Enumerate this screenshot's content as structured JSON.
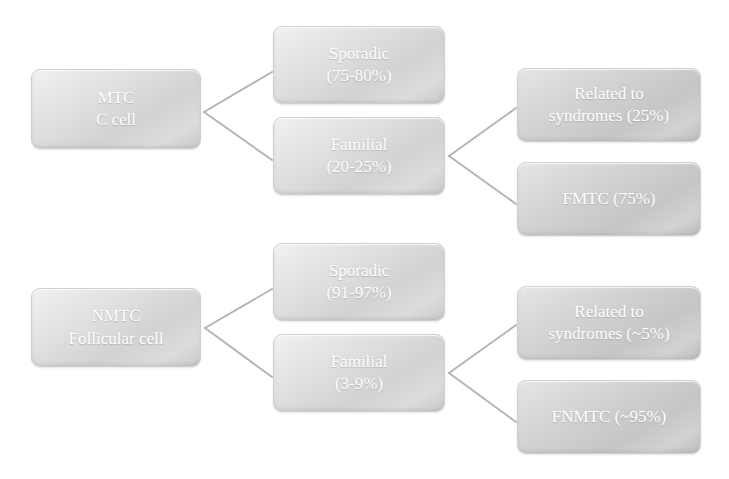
{
  "diagram": {
    "type": "hierarchy-tree",
    "orientation": "left-to-right",
    "colors": {
      "node_fill_light": "#dddddd",
      "node_fill_dark": "#cfcfcf",
      "node_text": "#ffffff",
      "connector": "#b3b3b3",
      "background": "#ffffff"
    },
    "branches": [
      {
        "id": "mtc",
        "root": {
          "id": "node-mtc",
          "line1": "MTC",
          "line2": "C cell"
        },
        "children": [
          {
            "id": "node-mtc-sporadic",
            "line1": "Sporadic",
            "line2": "(75-80%)",
            "children": []
          },
          {
            "id": "node-mtc-familial",
            "line1": "Familial",
            "line2": "(20-25%)",
            "children": [
              {
                "id": "node-mtc-syndromes",
                "line1": "Related to",
                "line2": "syndromes (25%)"
              },
              {
                "id": "node-fmtc",
                "line1": "FMTC (75%)",
                "line2": ""
              }
            ]
          }
        ]
      },
      {
        "id": "nmtc",
        "root": {
          "id": "node-nmtc",
          "line1": "NMTC",
          "line2": "Follicular cell"
        },
        "children": [
          {
            "id": "node-nmtc-sporadic",
            "line1": "Sporadic",
            "line2": "(91-97%)",
            "children": []
          },
          {
            "id": "node-nmtc-familial",
            "line1": "Familial",
            "line2": "(3-9%)",
            "children": [
              {
                "id": "node-nmtc-syndromes",
                "line1": "Related to",
                "line2": "syndromes (~5%)"
              },
              {
                "id": "node-fnmtc",
                "line1": "FNMTC (~95%)",
                "line2": ""
              }
            ]
          }
        ]
      }
    ]
  },
  "nodes": {
    "mtc": {
      "line1": "MTC",
      "line2": "C cell"
    },
    "mtc_sporadic": {
      "line1": "Sporadic",
      "line2": "(75-80%)"
    },
    "mtc_familial": {
      "line1": "Familial",
      "line2": "(20-25%)"
    },
    "mtc_syndromes": {
      "line1": "Related to",
      "line2": "syndromes (25%)"
    },
    "fmtc": {
      "line1": "FMTC (75%)",
      "line2": ""
    },
    "nmtc": {
      "line1": "NMTC",
      "line2": "Follicular cell"
    },
    "nmtc_sporadic": {
      "line1": "Sporadic",
      "line2": "(91-97%)"
    },
    "nmtc_familial": {
      "line1": "Familial",
      "line2": "(3-9%)"
    },
    "nmtc_syndromes": {
      "line1": "Related to",
      "line2": "syndromes (~5%)"
    },
    "fnmtc": {
      "line1": "FNMTC (~95%)",
      "line2": ""
    }
  }
}
